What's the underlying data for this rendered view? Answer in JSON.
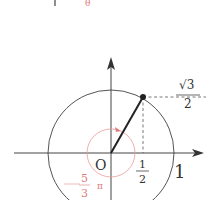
{
  "diagram": {
    "type": "unit-circle",
    "top_fragment": {
      "bar": "|",
      "red_glyph": "θ"
    },
    "origin_label": "O",
    "x_axis_unit_label": "1",
    "point": {
      "x_label_num": "1",
      "x_label_den": "2",
      "y_label_num": "√3",
      "y_label_den": "2"
    },
    "angle": {
      "label_sign": "−",
      "label_num": "5",
      "label_den": "3",
      "label_pi": "π",
      "value": "-5π/3"
    },
    "colors": {
      "ink": "#333333",
      "angle": "#e27a7a",
      "background": "#ffffff"
    }
  }
}
